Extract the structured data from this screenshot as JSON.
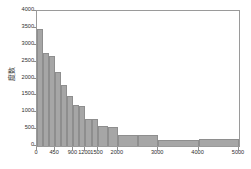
{
  "chart_data": {
    "type": "bar",
    "title": "",
    "subtitle": "",
    "xlabel": "",
    "ylabel": "度数",
    "xlim": [
      0,
      5000
    ],
    "ylim": [
      0,
      4000
    ],
    "grid": false,
    "legend": null,
    "orientation": "vertical",
    "note": "Histogram with unequal (variable-width) bins; right-skewed distribution",
    "x_tick_labels": [
      "0",
      "450",
      "900",
      "1200",
      "1500",
      "2000",
      "3000",
      "4000",
      "5000"
    ],
    "x_tick_values": [
      0,
      450,
      900,
      1200,
      1500,
      2000,
      3000,
      4000,
      5000
    ],
    "y_tick_labels": [
      "0",
      "500",
      "1000",
      "1500",
      "2000",
      "2500",
      "3000",
      "3500",
      "4000"
    ],
    "y_tick_values": [
      0,
      500,
      1000,
      1500,
      2000,
      2500,
      3000,
      3500,
      4000
    ],
    "bins": [
      {
        "start": 0,
        "end": 150,
        "value": 3480
      },
      {
        "start": 150,
        "end": 300,
        "value": 2770
      },
      {
        "start": 300,
        "end": 450,
        "value": 2660
      },
      {
        "start": 450,
        "end": 600,
        "value": 2180
      },
      {
        "start": 600,
        "end": 750,
        "value": 1820
      },
      {
        "start": 750,
        "end": 900,
        "value": 1470
      },
      {
        "start": 900,
        "end": 1050,
        "value": 1210
      },
      {
        "start": 1050,
        "end": 1200,
        "value": 1200
      },
      {
        "start": 1200,
        "end": 1350,
        "value": 800
      },
      {
        "start": 1350,
        "end": 1500,
        "value": 790
      },
      {
        "start": 1500,
        "end": 1750,
        "value": 580
      },
      {
        "start": 1750,
        "end": 2000,
        "value": 575
      },
      {
        "start": 2000,
        "end": 2500,
        "value": 320
      },
      {
        "start": 2500,
        "end": 3000,
        "value": 315
      },
      {
        "start": 3000,
        "end": 4000,
        "value": 175
      },
      {
        "start": 4000,
        "end": 5000,
        "value": 220
      }
    ],
    "colors": {
      "bar_fill": "#a6a6a6",
      "bar_edge": "#8e8e8e",
      "axis": "#9a9a9a",
      "tick_text": "#2e2e2e",
      "background": "#ffffff"
    }
  }
}
